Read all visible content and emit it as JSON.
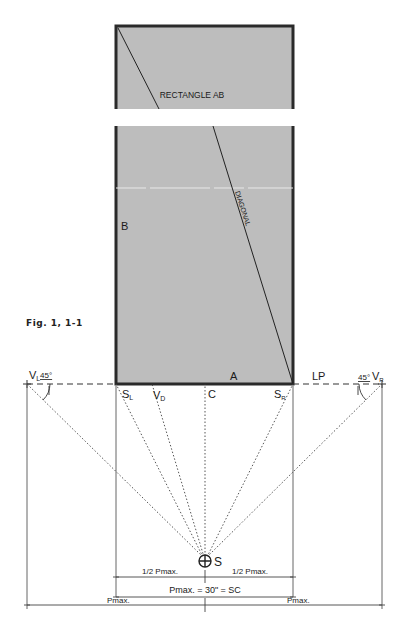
{
  "caption": "Fig. 1, 1-1",
  "colors": {
    "rect_fill": "#bdbdbd",
    "rect_border": "#2a2a2a",
    "line": "#333333",
    "background": "#ffffff"
  },
  "rectangle": {
    "title": "RECTANGLE AB",
    "diagonal_label": "DIAGONAL",
    "corner_b": "B",
    "corner_a": "A"
  },
  "baseline": {
    "label": "LP",
    "points": {
      "vl": "V",
      "vl_sub": "L",
      "vl_angle": "45°",
      "vr": "V",
      "vr_sub": "R",
      "vr_angle": "45°",
      "sl": "S",
      "sl_sub": "L",
      "vd": "V",
      "vd_sub": "D",
      "c": "C",
      "sr": "S",
      "sr_sub": "R"
    }
  },
  "station_point": {
    "label": "S"
  },
  "dimensions": {
    "half_left": "1/2 Pmax.",
    "half_right": "1/2 Pmax.",
    "full": "Pmax. = 30\" = SC",
    "outer_left": "Pmax.",
    "outer_right": "Pmax."
  }
}
